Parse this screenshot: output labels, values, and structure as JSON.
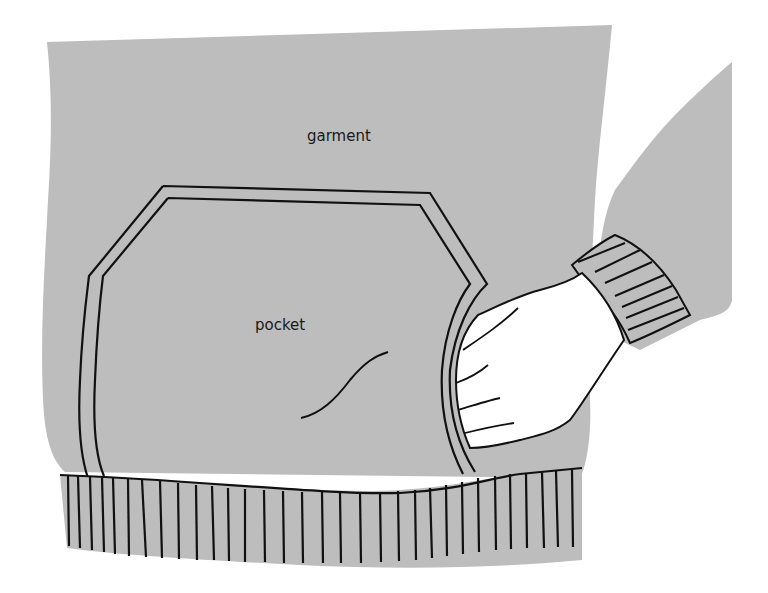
{
  "figure": {
    "type": "illustration",
    "colors": {
      "fabric": "#bdbdbd",
      "outline": "#111111",
      "skin": "#ffffff",
      "background": "#ffffff"
    }
  },
  "labels": {
    "garment": "garment",
    "pocket": "pocket"
  }
}
